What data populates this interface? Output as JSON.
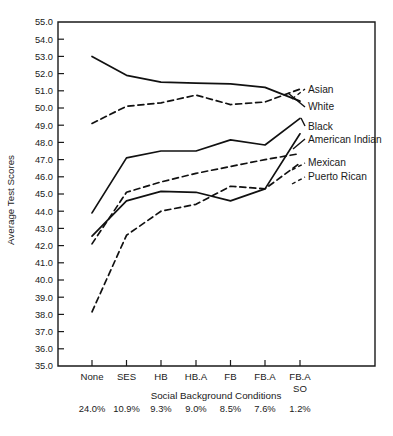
{
  "chart_data": {
    "type": "line",
    "title": "",
    "xlabel": "Social Background Conditions",
    "ylabel": "Average Test Scores",
    "ylim": [
      35.0,
      55.0
    ],
    "ytick_step": 1.0,
    "grid": false,
    "legend_position": "right-inline-labels",
    "categories": [
      "None",
      "SES",
      "HB",
      "HB.A",
      "FB",
      "FB.A",
      "FB.A SO"
    ],
    "category_percents": [
      "24.0%",
      "10.9%",
      "9.3%",
      "9.0%",
      "8.5%",
      "7.6%",
      "1.2%"
    ],
    "ytick_labels": [
      "55.0",
      "54.0",
      "53.0",
      "52.0",
      "51.0",
      "50.0",
      "49.0",
      "48.0",
      "47.0",
      "46.0",
      "45.0",
      "44.0",
      "43.0",
      "42.0",
      "41.0",
      "40.0",
      "39.0",
      "38.0",
      "37.0",
      "36.0",
      "35.0"
    ],
    "series": [
      {
        "name": "White",
        "style": "solid",
        "values": [
          53.0,
          51.9,
          51.5,
          51.45,
          51.4,
          51.2,
          50.4
        ]
      },
      {
        "name": "Asian",
        "style": "dashed",
        "values": [
          49.1,
          50.1,
          50.3,
          50.75,
          50.2,
          50.35,
          51.1
        ]
      },
      {
        "name": "Black",
        "style": "solid",
        "values": [
          43.9,
          47.1,
          47.5,
          47.5,
          48.15,
          47.85,
          49.4
        ]
      },
      {
        "name": "Mexican",
        "style": "dashed",
        "values": [
          42.1,
          45.1,
          45.7,
          46.2,
          46.6,
          47.0,
          47.35
        ]
      },
      {
        "name": "American Indian",
        "style": "solid",
        "values": [
          42.55,
          44.6,
          45.15,
          45.1,
          44.6,
          45.3,
          48.5
        ]
      },
      {
        "name": "Puerto Rican",
        "style": "dashed",
        "values": [
          38.15,
          42.6,
          44.0,
          44.4,
          45.45,
          45.3,
          46.8
        ]
      }
    ],
    "legend_entries": [
      {
        "label": "Asian",
        "style": "dashed"
      },
      {
        "label": "White",
        "style": "solid"
      },
      {
        "label": "Black",
        "style": "solid"
      },
      {
        "label": "American Indian",
        "style": "solid"
      },
      {
        "label": "Mexican",
        "style": "dashed"
      },
      {
        "label": "Puerto Rican",
        "style": "dashed"
      }
    ]
  },
  "legend": {
    "asian": "Asian",
    "white": "White",
    "black": "Black",
    "american_indian": "American Indian",
    "mexican": "Mexican",
    "puerto_rican": "Puerto Rican"
  },
  "axes": {
    "y_title": "Average Test Scores",
    "x_title": "Social Background Conditions",
    "y_ticks": [
      "55.0",
      "54.0",
      "53.0",
      "52.0",
      "51.0",
      "50.0",
      "49.0",
      "48.0",
      "47.0",
      "46.0",
      "45.0",
      "44.0",
      "43.0",
      "42.0",
      "41.0",
      "40.0",
      "39.0",
      "38.0",
      "37.0",
      "36.0",
      "35.0"
    ],
    "x_ticks": [
      "None",
      "SES",
      "HB",
      "HB.A",
      "FB",
      "FB.A",
      "FB.A"
    ],
    "x_tick_last_second_line": "SO",
    "percents": [
      "24.0%",
      "10.9%",
      "9.3%",
      "9.0%",
      "8.5%",
      "7.6%",
      "1.2%"
    ]
  }
}
